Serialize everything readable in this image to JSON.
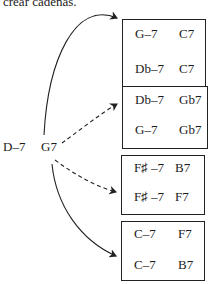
{
  "caption_fragment": "crear cadenas.",
  "source": {
    "chord1": "D–7",
    "chord2": "G7"
  },
  "arrows": [
    {
      "target": "box-1",
      "style": "solid"
    },
    {
      "target": "box-2",
      "style": "dashed"
    },
    {
      "target": "box-3",
      "style": "dashed"
    },
    {
      "target": "box-4",
      "style": "solid"
    }
  ],
  "boxes": [
    {
      "rows": [
        {
          "a": "G–7",
          "b": "C7"
        },
        {
          "a": "Db–7",
          "b": "C7"
        }
      ]
    },
    {
      "rows": [
        {
          "a": "Db–7",
          "b": "Gb7"
        },
        {
          "a": "G–7",
          "b": "Gb7"
        }
      ]
    },
    {
      "rows": [
        {
          "a": "F♯ –7",
          "b": "B7"
        },
        {
          "a": "F♯ –7",
          "b": "F7"
        }
      ]
    },
    {
      "rows": [
        {
          "a": "C–7",
          "b": "F7"
        },
        {
          "a": "C–7",
          "b": "B7"
        }
      ]
    }
  ],
  "colors": {
    "ink": "#1a1a1a",
    "background": "#ffffff"
  }
}
